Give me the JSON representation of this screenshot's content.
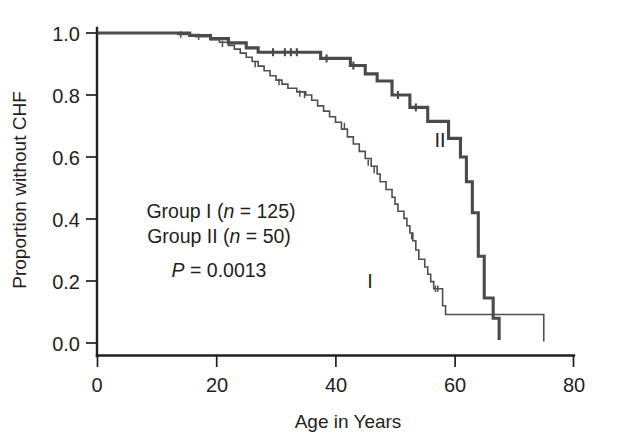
{
  "chart_data": {
    "type": "line",
    "title": "",
    "subtitle": "",
    "xlabel": "Age in Years",
    "ylabel": "Proportion without CHF",
    "xlim": [
      0,
      80
    ],
    "ylim": [
      0.0,
      1.0
    ],
    "grid": false,
    "legend_position": "inline-curve-labels",
    "xticks": [
      0,
      20,
      40,
      60,
      80
    ],
    "xticklabels": [
      "0",
      "20",
      "40",
      "60",
      "80"
    ],
    "yticks": [
      0.0,
      0.2,
      0.4,
      0.6,
      0.8,
      1.0
    ],
    "yticklabels": [
      "0.0",
      "0.2",
      "0.4",
      "0.6",
      "0.8",
      "1.0"
    ],
    "series": [
      {
        "name": "I",
        "label": "I",
        "n": 125,
        "legend_text": "Group I (n = 125)",
        "color": "#4f4f4f",
        "linewidth": "thin",
        "curve_label_position": {
          "x": 47.5,
          "y": 0.175
        },
        "step_points": [
          [
            0.0,
            1.0
          ],
          [
            13.0,
            1.0
          ],
          [
            13.5,
            0.995
          ],
          [
            16.0,
            0.995
          ],
          [
            16.5,
            0.988
          ],
          [
            18.0,
            0.988
          ],
          [
            19.0,
            0.978
          ],
          [
            20.5,
            0.97
          ],
          [
            22.0,
            0.96
          ],
          [
            23.0,
            0.948
          ],
          [
            24.0,
            0.935
          ],
          [
            25.0,
            0.922
          ],
          [
            26.0,
            0.908
          ],
          [
            27.0,
            0.893
          ],
          [
            28.0,
            0.878
          ],
          [
            29.0,
            0.862
          ],
          [
            30.0,
            0.848
          ],
          [
            31.0,
            0.835
          ],
          [
            32.0,
            0.822
          ],
          [
            33.5,
            0.81
          ],
          [
            35.0,
            0.8
          ],
          [
            36.0,
            0.783
          ],
          [
            37.0,
            0.765
          ],
          [
            38.0,
            0.748
          ],
          [
            39.0,
            0.73
          ],
          [
            40.0,
            0.712
          ],
          [
            41.0,
            0.69
          ],
          [
            42.0,
            0.665
          ],
          [
            43.0,
            0.642
          ],
          [
            44.0,
            0.618
          ],
          [
            45.0,
            0.595
          ],
          [
            46.0,
            0.57
          ],
          [
            47.0,
            0.545
          ],
          [
            47.5,
            0.52
          ],
          [
            48.5,
            0.495
          ],
          [
            49.5,
            0.47
          ],
          [
            50.0,
            0.448
          ],
          [
            50.5,
            0.425
          ],
          [
            51.5,
            0.402
          ],
          [
            52.0,
            0.378
          ],
          [
            52.5,
            0.355
          ],
          [
            53.0,
            0.33
          ],
          [
            53.5,
            0.3
          ],
          [
            54.0,
            0.27
          ],
          [
            55.0,
            0.245
          ],
          [
            55.5,
            0.222
          ],
          [
            56.0,
            0.198
          ],
          [
            56.5,
            0.175
          ],
          [
            57.5,
            0.175
          ],
          [
            58.0,
            0.12
          ],
          [
            58.5,
            0.092
          ],
          [
            67.0,
            0.092
          ],
          [
            75.0,
            0.092
          ],
          [
            75.0,
            0.005
          ]
        ],
        "censor_marks": [
          [
            14.0,
            0.995
          ],
          [
            17.0,
            0.988
          ],
          [
            21.0,
            0.965
          ],
          [
            26.5,
            0.9
          ],
          [
            30.5,
            0.842
          ],
          [
            34.0,
            0.805
          ],
          [
            34.8,
            0.8
          ],
          [
            41.5,
            0.7
          ],
          [
            45.5,
            0.582
          ],
          [
            46.5,
            0.558
          ],
          [
            52.8,
            0.345
          ],
          [
            56.8,
            0.175
          ],
          [
            57.2,
            0.175
          ]
        ]
      },
      {
        "name": "II",
        "label": "II",
        "n": 50,
        "legend_text": "Group II (n = 50)",
        "color": "#4a4a4a",
        "linewidth": "thick",
        "curve_label_position": {
          "x": 57.5,
          "y": 0.64
        },
        "step_points": [
          [
            0.0,
            1.0
          ],
          [
            14.5,
            1.0
          ],
          [
            15.5,
            0.992
          ],
          [
            18.0,
            0.992
          ],
          [
            19.0,
            0.982
          ],
          [
            21.0,
            0.982
          ],
          [
            22.0,
            0.968
          ],
          [
            24.0,
            0.968
          ],
          [
            25.0,
            0.952
          ],
          [
            26.0,
            0.952
          ],
          [
            27.0,
            0.938
          ],
          [
            35.5,
            0.938
          ],
          [
            37.5,
            0.918
          ],
          [
            41.0,
            0.918
          ],
          [
            42.5,
            0.895
          ],
          [
            44.5,
            0.895
          ],
          [
            45.0,
            0.868
          ],
          [
            46.0,
            0.868
          ],
          [
            47.0,
            0.845
          ],
          [
            48.5,
            0.845
          ],
          [
            49.5,
            0.8
          ],
          [
            51.5,
            0.8
          ],
          [
            52.5,
            0.76
          ],
          [
            55.0,
            0.76
          ],
          [
            55.5,
            0.715
          ],
          [
            58.5,
            0.715
          ],
          [
            59.0,
            0.66
          ],
          [
            60.5,
            0.66
          ],
          [
            61.0,
            0.6
          ],
          [
            61.5,
            0.6
          ],
          [
            62.0,
            0.52
          ],
          [
            62.5,
            0.52
          ],
          [
            63.0,
            0.42
          ],
          [
            63.5,
            0.42
          ],
          [
            64.0,
            0.28
          ],
          [
            64.5,
            0.28
          ],
          [
            65.0,
            0.145
          ],
          [
            66.0,
            0.145
          ],
          [
            66.5,
            0.08
          ],
          [
            67.5,
            0.08
          ],
          [
            67.5,
            0.01
          ]
        ],
        "censor_marks": [
          [
            29.5,
            0.938
          ],
          [
            31.5,
            0.938
          ],
          [
            32.5,
            0.938
          ],
          [
            33.5,
            0.938
          ],
          [
            38.5,
            0.918
          ],
          [
            43.0,
            0.895
          ],
          [
            50.5,
            0.8
          ],
          [
            53.5,
            0.76
          ]
        ]
      }
    ],
    "annotations": [
      {
        "id": "group-1-legend",
        "text": "Group I (n = 125)",
        "italic_part": "n"
      },
      {
        "id": "group-2-legend",
        "text": "Group II (n = 50)",
        "italic_part": "n"
      },
      {
        "id": "p-value",
        "text": "P = 0.0013",
        "italic_part": "P"
      }
    ]
  },
  "annotation_block": {
    "line1_prefix": "Group I (",
    "line1_italic": "n",
    "line1_suffix": " = 125)",
    "line2_prefix": "Group II (",
    "line2_italic": "n",
    "line2_suffix": " = 50)",
    "line3_italic": "P",
    "line3_suffix": " = 0.0013"
  },
  "axes": {
    "x_title": "Age in Years",
    "y_title": "Proportion without CHF",
    "x_ticks": [
      "0",
      "20",
      "40",
      "60",
      "80"
    ],
    "y_ticks": [
      "1.0",
      "0.8",
      "0.6",
      "0.4",
      "0.2",
      "0.0"
    ]
  },
  "series_labels": {
    "one": "I",
    "two": "II"
  },
  "colors": {
    "axis": "#231f20",
    "curve_group_1": "#4f4f4f",
    "curve_group_2": "#4a4a4a",
    "background": "#ffffff"
  }
}
